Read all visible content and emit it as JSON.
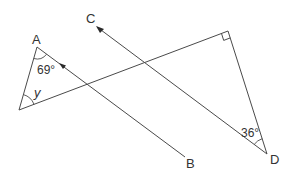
{
  "diagram": {
    "type": "geometry",
    "points": {
      "A": {
        "label": "A"
      },
      "B": {
        "label": "B"
      },
      "C": {
        "label": "C"
      },
      "D": {
        "label": "D"
      }
    },
    "angles": {
      "at_A": "69°",
      "at_left_vertex": "y",
      "at_D": "36°",
      "right_angle_marker": "right angle at top-right vertex"
    },
    "parallel_arrows": "Lines AB and CD marked parallel with single arrowheads"
  },
  "colors": {
    "line": "#4a4a4a",
    "text": "#333333",
    "background": "#ffffff"
  }
}
